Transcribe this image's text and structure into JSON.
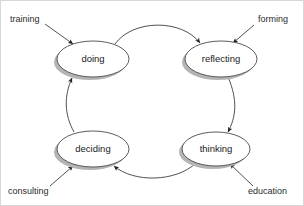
{
  "diagram": {
    "type": "cycle-diagram",
    "direction": "clockwise",
    "background_color": "#ffffff",
    "node_fill_color": "#ffffff",
    "node_stroke_color": "#4a4a4a",
    "shadow_color": "#b4b4b4",
    "edge_color": "#3d3d3d",
    "text_color": "#1a1a1a"
  },
  "nodes": [
    {
      "id": "doing",
      "label": "doing",
      "cx": 93,
      "cy": 59,
      "rx": 36,
      "ry": 18
    },
    {
      "id": "reflecting",
      "label": "reflecting",
      "cx": 221,
      "cy": 59,
      "rx": 36,
      "ry": 18
    },
    {
      "id": "thinking",
      "label": "thinking",
      "cx": 216,
      "cy": 149,
      "rx": 34,
      "ry": 17
    },
    {
      "id": "deciding",
      "label": "deciding",
      "cx": 93,
      "cy": 149,
      "rx": 36,
      "ry": 18
    }
  ],
  "edges": [
    {
      "id": "doing-to-reflecting",
      "from": "doing",
      "to": "reflecting",
      "arrow": true
    },
    {
      "id": "reflecting-to-thinking",
      "from": "reflecting",
      "to": "thinking",
      "arrow": true
    },
    {
      "id": "thinking-to-deciding",
      "from": "thinking",
      "to": "deciding",
      "arrow": true
    },
    {
      "id": "deciding-to-doing",
      "from": "deciding",
      "to": "doing",
      "arrow": true
    }
  ],
  "inputs": [
    {
      "id": "training",
      "label": "training",
      "target": "doing",
      "position": "top-left",
      "text_x": 10,
      "text_y": 22
    },
    {
      "id": "forming",
      "label": "forming",
      "target": "reflecting",
      "position": "top-right",
      "text_x": 252,
      "text_y": 22
    },
    {
      "id": "consulting",
      "label": "consulting",
      "target": "deciding",
      "position": "bottom-left",
      "text_x": 8,
      "text_y": 194
    },
    {
      "id": "education",
      "label": "education",
      "target": "thinking",
      "position": "bottom-right",
      "text_x": 248,
      "text_y": 194
    }
  ]
}
